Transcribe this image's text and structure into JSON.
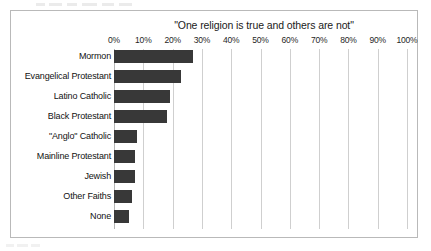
{
  "figure": {
    "border_color": "#b9b9b9",
    "background": "#ffffff"
  },
  "chart_data": {
    "type": "bar",
    "orientation": "horizontal",
    "title": "\"One religion is true and others are not\"",
    "xlabel": "",
    "ylabel": "",
    "xlim": [
      0,
      100
    ],
    "xtick_labels": [
      "0%",
      "10%",
      "20%",
      "30%",
      "40%",
      "50%",
      "60%",
      "70%",
      "80%",
      "90%",
      "100%"
    ],
    "xtick_values": [
      0,
      10,
      20,
      30,
      40,
      50,
      60,
      70,
      80,
      90,
      100
    ],
    "grid": "vertical",
    "legend": "none",
    "bar_color": "#383838",
    "categories": [
      "Mormon",
      "Evangelical Protestant",
      "Latino Catholic",
      "Black Protestant",
      "\"Anglo\" Catholic",
      "Mainline Protestant",
      "Jewish",
      "Other Faiths",
      "None"
    ],
    "values": [
      27,
      23,
      19,
      18,
      8,
      7,
      7,
      6,
      5
    ]
  }
}
